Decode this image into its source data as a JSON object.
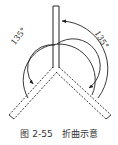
{
  "diagram": {
    "title": "折曲示意",
    "figure_number": "图 2-55",
    "stroke_color": "#222222",
    "background": "#ffffff",
    "elements": {
      "vertical_bar": {
        "style": "solid",
        "description": "upright strip"
      },
      "left_arm": {
        "style": "dashed",
        "description": "bent strip lower-left"
      },
      "right_arm": {
        "style": "dashed",
        "description": "bent strip lower-right"
      },
      "outer_arc": {
        "label": "135°",
        "arrow": "end near top of vertical bar"
      },
      "inner_arc": {
        "label": "135°",
        "arrow": "end near left arm"
      }
    },
    "labels": {
      "left_angle": "135°",
      "right_angle": "135°"
    }
  },
  "caption": {
    "figure_number": "图 2-55",
    "text": "折曲示意"
  }
}
